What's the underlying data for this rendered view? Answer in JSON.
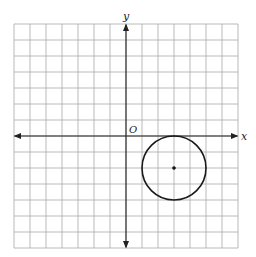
{
  "chart_data": {
    "type": "scatter",
    "title": "",
    "xlabel": "x",
    "ylabel": "y",
    "origin_label": "O",
    "xlim": [
      -7,
      7
    ],
    "ylim": [
      -7,
      7
    ],
    "grid": true,
    "grid_step": 1,
    "tick_labels": false,
    "axes_arrows": true,
    "shapes": [
      {
        "kind": "circle",
        "center": [
          3,
          -2
        ],
        "radius": 2,
        "center_marked": true
      }
    ],
    "colors": {
      "grid": "#a8a8a8",
      "axis": "#222222",
      "circle": "#1a1a1a"
    }
  }
}
